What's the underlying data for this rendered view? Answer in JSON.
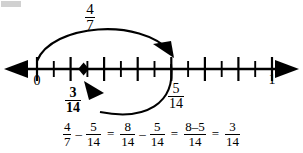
{
  "diagram": {
    "type": "number-line-fraction-subtraction",
    "line": {
      "start_label": "0",
      "end_label": "1",
      "divisions": 14,
      "tick_count_between": 14
    },
    "point_marker": {
      "name": "result-point",
      "value_numerator": "3",
      "value_denominator": "14",
      "position_fraction": 0.2142857
    },
    "arc_top": {
      "label_numerator": "4",
      "label_denominator": "7",
      "from_fraction": 0,
      "to_fraction": 0.5714286,
      "direction": "right"
    },
    "arc_bottom": {
      "label_numerator": "5",
      "label_denominator": "14",
      "from_fraction": 0.5714286,
      "to_fraction": 0.2142857,
      "direction": "left"
    },
    "labels": {
      "four_sevenths_num": "4",
      "four_sevenths_den": "7",
      "three_fourteenths_num": "3",
      "three_fourteenths_den": "14",
      "five_fourteenths_num": "5",
      "five_fourteenths_den": "14"
    },
    "equation": {
      "t1_num": "4",
      "t1_den": "7",
      "minus1": "–",
      "t2_num": "5",
      "t2_den": "14",
      "equals1": "=",
      "t3_num": "8",
      "t3_den": "14",
      "minus2": "–",
      "t4_num": "5",
      "t4_den": "14",
      "equals2": "=",
      "t5_num": "8–5",
      "t5_den": "14",
      "equals3": "=",
      "t6_num": "3",
      "t6_den": "14"
    },
    "colors": {
      "ink": "#000000",
      "background": "#ffffff"
    }
  }
}
